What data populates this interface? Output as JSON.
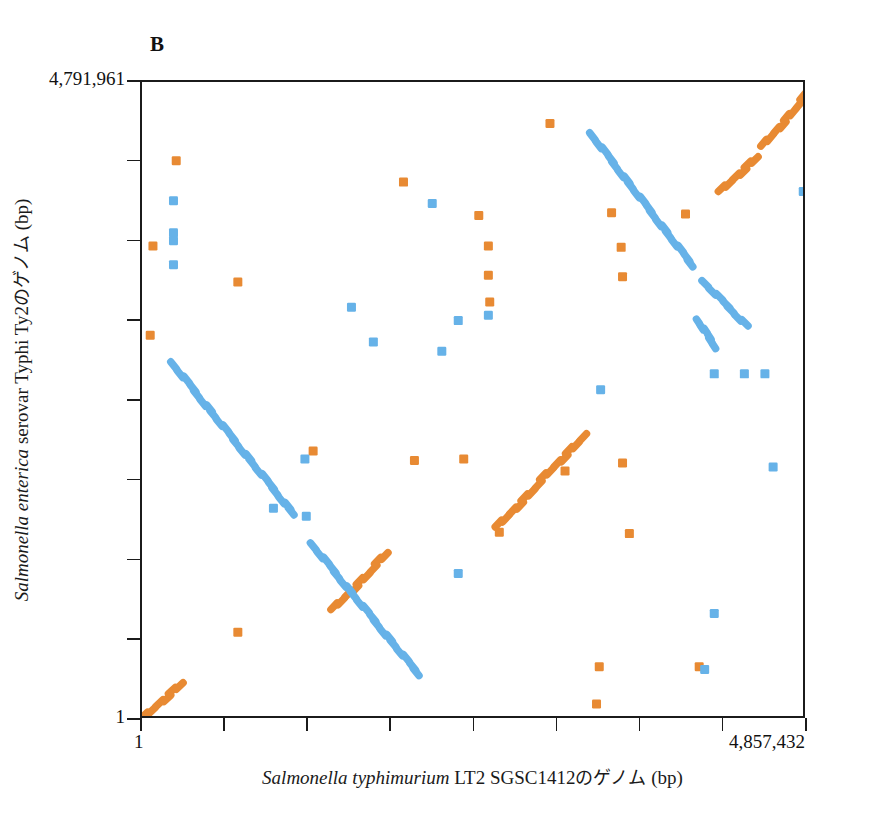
{
  "figure": {
    "panel_label": "B",
    "colors": {
      "forward_match": "#e88a33",
      "reverse_match": "#66b2e8",
      "axis": "#1b1b1b",
      "background": "#ffffff"
    }
  },
  "axes": {
    "x": {
      "title_italic": "Salmonella typhimurium",
      "title_rest": " LT2 SGSC1412",
      "title_jp": "のゲノム",
      "title_unit": " (bp)",
      "min_label": "1",
      "max_label": "4,857,432",
      "min_value": 1,
      "max_value": 4857432,
      "n_ticks": 9
    },
    "y": {
      "title_italic": "Salmonella enterica",
      "title_rest": " serovar Typhi Ty2",
      "title_jp": "のゲノム",
      "title_unit": " (bp)",
      "min_label": "1",
      "max_label": "4,791,961",
      "min_value": 1,
      "max_value": 4791961,
      "n_ticks": 9
    }
  },
  "chart_data": {
    "type": "scatter",
    "title": "B",
    "xlabel": "Salmonella typhimurium LT2 SGSC1412のゲノム (bp)",
    "ylabel": "Salmonella enterica serovar Typhi Ty2のゲノム (bp)",
    "xlim": [
      1,
      4857432
    ],
    "ylim": [
      1,
      4791961
    ],
    "grid": false,
    "legend": "none",
    "series": [
      {
        "name": "forward-match",
        "color": "#e88a33",
        "orientation": "forward",
        "segments": [
          {
            "x0": 1,
            "y0": 1,
            "x1": 300000,
            "y1": 290000
          },
          {
            "x0": 2590000,
            "y0": 1440000,
            "x1": 3240000,
            "y1": 2150000
          },
          {
            "x0": 1390000,
            "y0": 820000,
            "x1": 1800000,
            "y1": 1260000
          },
          {
            "x0": 4220000,
            "y0": 3960000,
            "x1": 4500000,
            "y1": 4240000
          },
          {
            "x0": 4530000,
            "y0": 4300000,
            "x1": 4857432,
            "y1": 4700000
          }
        ],
        "points": [
          {
            "x": 250000,
            "y": 4200000
          },
          {
            "x": 2980000,
            "y": 4480000
          },
          {
            "x": 1910000,
            "y": 4040000
          },
          {
            "x": 2460000,
            "y": 3790000
          },
          {
            "x": 3430000,
            "y": 3810000
          },
          {
            "x": 3970000,
            "y": 3800000
          },
          {
            "x": 80000,
            "y": 3560000
          },
          {
            "x": 2530000,
            "y": 3560000
          },
          {
            "x": 3500000,
            "y": 3550000
          },
          {
            "x": 2530000,
            "y": 3340000
          },
          {
            "x": 3510000,
            "y": 3330000
          },
          {
            "x": 2540000,
            "y": 3140000
          },
          {
            "x": 60000,
            "y": 2890000
          },
          {
            "x": 700000,
            "y": 3290000
          },
          {
            "x": 1250000,
            "y": 2020000
          },
          {
            "x": 1990000,
            "y": 1950000
          },
          {
            "x": 2350000,
            "y": 1960000
          },
          {
            "x": 3510000,
            "y": 1930000
          },
          {
            "x": 3090000,
            "y": 1870000
          },
          {
            "x": 700000,
            "y": 660000
          },
          {
            "x": 3340000,
            "y": 400000
          },
          {
            "x": 4070000,
            "y": 400000
          },
          {
            "x": 3320000,
            "y": 120000
          },
          {
            "x": 3560000,
            "y": 1400000
          },
          {
            "x": 2610000,
            "y": 1410000
          }
        ]
      },
      {
        "name": "reverse-match",
        "color": "#66b2e8",
        "orientation": "reverse",
        "segments": [
          {
            "x0": 220000,
            "y0": 2680000,
            "x1": 1120000,
            "y1": 1530000
          },
          {
            "x0": 1240000,
            "y0": 1320000,
            "x1": 2030000,
            "y1": 330000
          },
          {
            "x0": 3280000,
            "y0": 4400000,
            "x1": 4030000,
            "y1": 3400000
          },
          {
            "x0": 4100000,
            "y0": 3290000,
            "x1": 4420000,
            "y1": 2960000
          },
          {
            "x0": 4060000,
            "y0": 3000000,
            "x1": 4190000,
            "y1": 2800000
          }
        ],
        "points": [
          {
            "x": 230000,
            "y": 3900000
          },
          {
            "x": 230000,
            "y": 3660000
          },
          {
            "x": 230000,
            "y": 3600000
          },
          {
            "x": 230000,
            "y": 3420000
          },
          {
            "x": 4830000,
            "y": 3970000
          },
          {
            "x": 1530000,
            "y": 3100000
          },
          {
            "x": 2120000,
            "y": 3880000
          },
          {
            "x": 2530000,
            "y": 3040000
          },
          {
            "x": 1690000,
            "y": 2840000
          },
          {
            "x": 2190000,
            "y": 2770000
          },
          {
            "x": 3350000,
            "y": 2480000
          },
          {
            "x": 4180000,
            "y": 2600000
          },
          {
            "x": 4400000,
            "y": 2600000
          },
          {
            "x": 4550000,
            "y": 2600000
          },
          {
            "x": 4610000,
            "y": 1900000
          },
          {
            "x": 1190000,
            "y": 1960000
          },
          {
            "x": 960000,
            "y": 1590000
          },
          {
            "x": 1200000,
            "y": 1530000
          },
          {
            "x": 2310000,
            "y": 1100000
          },
          {
            "x": 4180000,
            "y": 800000
          },
          {
            "x": 4110000,
            "y": 380000
          },
          {
            "x": 2310000,
            "y": 3000000
          }
        ]
      }
    ]
  }
}
